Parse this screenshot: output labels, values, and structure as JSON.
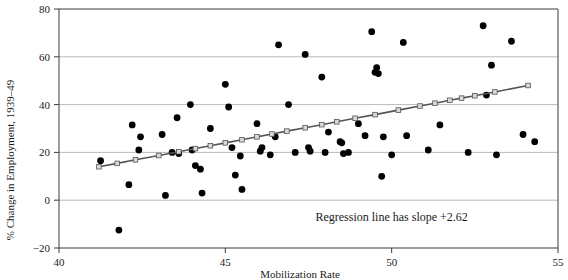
{
  "chart_data": {
    "type": "scatter",
    "title": "",
    "xlabel": "Mobilization Rate",
    "ylabel": "% Change in Employment, 1939–49",
    "xlim": [
      40,
      55
    ],
    "ylim": [
      -20,
      80
    ],
    "xticks": [
      40,
      45,
      50,
      55
    ],
    "xtick_labels": [
      "40",
      "45",
      "50",
      "55"
    ],
    "yticks": [
      -20,
      0,
      20,
      40,
      60,
      80
    ],
    "ytick_labels": [
      "−20",
      "0",
      "20",
      "40",
      "60",
      "80"
    ],
    "grid": "horizontal",
    "legend": "none",
    "annotations": [
      {
        "text": "Regression line has slope +2.62",
        "x": 50.0,
        "y": -8.5
      }
    ],
    "series": [
      {
        "name": "States",
        "type": "scatter",
        "marker": "filled-circle",
        "color": "#000000",
        "points": [
          [
            41.25,
            16.5
          ],
          [
            41.8,
            -12.5
          ],
          [
            42.1,
            6.5
          ],
          [
            42.2,
            31.5
          ],
          [
            42.4,
            21.0
          ],
          [
            42.45,
            26.5
          ],
          [
            43.1,
            27.5
          ],
          [
            43.2,
            2.0
          ],
          [
            43.4,
            20.0
          ],
          [
            43.55,
            34.5
          ],
          [
            43.6,
            19.5
          ],
          [
            43.95,
            40.0
          ],
          [
            44.1,
            14.5
          ],
          [
            44.25,
            13.0
          ],
          [
            44.3,
            3.0
          ],
          [
            44.55,
            30.0
          ],
          [
            45.0,
            48.5
          ],
          [
            45.1,
            39.0
          ],
          [
            45.2,
            22.0
          ],
          [
            45.3,
            10.5
          ],
          [
            45.45,
            18.5
          ],
          [
            45.5,
            4.5
          ],
          [
            45.95,
            32.0
          ],
          [
            46.1,
            22.0
          ],
          [
            46.35,
            19.0
          ],
          [
            46.5,
            26.5
          ],
          [
            46.6,
            65.0
          ],
          [
            46.9,
            40.0
          ],
          [
            47.1,
            20.0
          ],
          [
            47.4,
            61.0
          ],
          [
            47.5,
            22.0
          ],
          [
            47.55,
            20.5
          ],
          [
            47.9,
            51.5
          ],
          [
            48.0,
            20.0
          ],
          [
            48.1,
            28.5
          ],
          [
            48.45,
            24.5
          ],
          [
            48.5,
            24.0
          ],
          [
            48.55,
            19.5
          ],
          [
            48.7,
            20.0
          ],
          [
            49.0,
            32.0
          ],
          [
            49.2,
            27.0
          ],
          [
            49.4,
            70.5
          ],
          [
            49.55,
            55.5
          ],
          [
            49.6,
            53.0
          ],
          [
            49.7,
            10.0
          ],
          [
            49.75,
            26.5
          ],
          [
            50.0,
            19.0
          ],
          [
            50.35,
            66.0
          ],
          [
            50.45,
            27.0
          ],
          [
            51.1,
            21.0
          ],
          [
            51.45,
            31.5
          ],
          [
            52.3,
            20.0
          ],
          [
            52.75,
            73.0
          ],
          [
            52.85,
            44.0
          ],
          [
            53.0,
            56.5
          ],
          [
            53.15,
            19.0
          ],
          [
            53.6,
            66.5
          ],
          [
            53.95,
            27.5
          ],
          [
            54.3,
            24.5
          ],
          [
            49.5,
            53.5
          ],
          [
            46.05,
            20.5
          ],
          [
            44.0,
            21.0
          ]
        ]
      },
      {
        "name": "Regression line",
        "type": "line",
        "marker": "open-square",
        "line_color": "#555555",
        "marker_fill": "#d9d9d9",
        "slope": 2.62,
        "points": [
          [
            41.2,
            14.0
          ],
          [
            41.75,
            15.4
          ],
          [
            42.3,
            16.9
          ],
          [
            43.0,
            18.7
          ],
          [
            43.6,
            20.3
          ],
          [
            44.1,
            21.6
          ],
          [
            44.55,
            22.8
          ],
          [
            45.0,
            24.0
          ],
          [
            45.5,
            25.3
          ],
          [
            45.95,
            26.5
          ],
          [
            46.4,
            27.7
          ],
          [
            46.85,
            28.9
          ],
          [
            47.4,
            30.3
          ],
          [
            47.9,
            31.6
          ],
          [
            48.35,
            32.8
          ],
          [
            48.9,
            34.3
          ],
          [
            49.5,
            35.8
          ],
          [
            50.2,
            37.7
          ],
          [
            50.85,
            39.4
          ],
          [
            51.3,
            40.6
          ],
          [
            51.75,
            41.8
          ],
          [
            52.1,
            42.7
          ],
          [
            52.5,
            43.7
          ],
          [
            53.1,
            45.3
          ],
          [
            54.1,
            48.0
          ]
        ]
      }
    ]
  }
}
